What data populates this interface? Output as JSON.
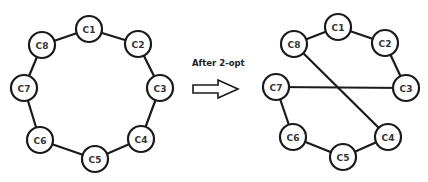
{
  "caption": "After 2-opt",
  "colors": {
    "stroke": "#1a1a1a",
    "node_fill": "#ffffff",
    "label": "#333333"
  },
  "left_tour": {
    "nodes": [
      {
        "id": "C1",
        "x": 89,
        "y": 29
      },
      {
        "id": "C2",
        "x": 138,
        "y": 44
      },
      {
        "id": "C3",
        "x": 160,
        "y": 88
      },
      {
        "id": "C4",
        "x": 141,
        "y": 139
      },
      {
        "id": "C5",
        "x": 95,
        "y": 159
      },
      {
        "id": "C6",
        "x": 40,
        "y": 140
      },
      {
        "id": "C7",
        "x": 24,
        "y": 88
      },
      {
        "id": "C8",
        "x": 42,
        "y": 45
      }
    ],
    "edges": [
      [
        "C1",
        "C2"
      ],
      [
        "C2",
        "C3"
      ],
      [
        "C3",
        "C4"
      ],
      [
        "C4",
        "C5"
      ],
      [
        "C5",
        "C6"
      ],
      [
        "C6",
        "C7"
      ],
      [
        "C7",
        "C8"
      ],
      [
        "C8",
        "C1"
      ]
    ]
  },
  "right_tour": {
    "nodes": [
      {
        "id": "C1",
        "x": 338,
        "y": 27
      },
      {
        "id": "C2",
        "x": 385,
        "y": 43
      },
      {
        "id": "C3",
        "x": 406,
        "y": 88
      },
      {
        "id": "C4",
        "x": 388,
        "y": 137
      },
      {
        "id": "C5",
        "x": 343,
        "y": 157
      },
      {
        "id": "C6",
        "x": 293,
        "y": 137
      },
      {
        "id": "C7",
        "x": 276,
        "y": 87
      },
      {
        "id": "C8",
        "x": 294,
        "y": 44
      }
    ],
    "edges": [
      [
        "C1",
        "C2"
      ],
      [
        "C2",
        "C3"
      ],
      [
        "C3",
        "C7"
      ],
      [
        "C7",
        "C6"
      ],
      [
        "C6",
        "C5"
      ],
      [
        "C5",
        "C4"
      ],
      [
        "C4",
        "C8"
      ],
      [
        "C8",
        "C1"
      ]
    ]
  },
  "node_radius": 13
}
